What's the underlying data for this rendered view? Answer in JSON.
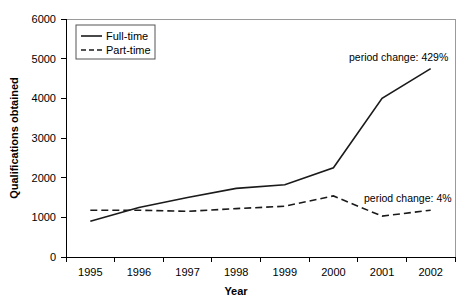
{
  "chart_data": {
    "type": "line",
    "title": "",
    "xlabel": "Year",
    "ylabel": "Qualifications obtained",
    "categories": [
      "1995",
      "1996",
      "1997",
      "1998",
      "1999",
      "2000",
      "2001",
      "2002"
    ],
    "series": [
      {
        "name": "Full-time",
        "style": "solid",
        "values": [
          900,
          1250,
          1500,
          1730,
          1820,
          2250,
          4000,
          4750
        ]
      },
      {
        "name": "Part-time",
        "style": "dashed",
        "values": [
          1180,
          1180,
          1150,
          1220,
          1280,
          1540,
          1030,
          1180
        ]
      }
    ],
    "ylim": [
      0,
      6000
    ],
    "yticks": [
      "0",
      "1000",
      "2000",
      "3000",
      "4000",
      "5000",
      "6000"
    ],
    "grid": false,
    "legend_position": "top-left",
    "annotations": [
      {
        "id": "fulltime-period-change",
        "text": "period change: 429%",
        "series": "Full-time"
      },
      {
        "id": "parttime-period-change",
        "text": "period change: 4%",
        "series": "Part-time"
      }
    ]
  },
  "legend": {
    "items": [
      {
        "label": "Full-time"
      },
      {
        "label": "Part-time"
      }
    ]
  },
  "colors": {
    "line": "#1a1a1a",
    "axis": "#000000",
    "frame": "#9a9a9a",
    "background": "#ffffff"
  }
}
